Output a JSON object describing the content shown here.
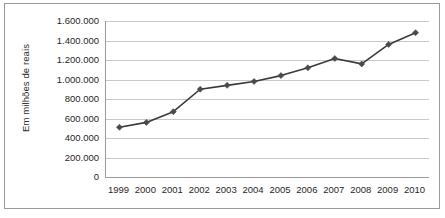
{
  "chart_data": {
    "type": "line",
    "title": "",
    "subtitle": "",
    "xlabel": "",
    "ylabel": "Em milhões de reais",
    "categories": [
      "1999",
      "2000",
      "2001",
      "2002",
      "2003",
      "2004",
      "2005",
      "2006",
      "2007",
      "2008",
      "2009",
      "2010"
    ],
    "values": [
      510000,
      560000,
      670000,
      900000,
      940000,
      980000,
      1040000,
      1120000,
      1215000,
      1160000,
      1360000,
      1480000
    ],
    "series": [
      {
        "name": "Em milhões de reais",
        "values": [
          510000,
          560000,
          670000,
          900000,
          940000,
          980000,
          1040000,
          1120000,
          1215000,
          1160000,
          1360000,
          1480000
        ]
      }
    ],
    "ylim": [
      0,
      1600000
    ],
    "ytick_values": [
      0,
      200000,
      400000,
      600000,
      800000,
      1000000,
      1200000,
      1400000,
      1600000
    ],
    "ytick_labels": [
      "0",
      "200.000",
      "400.000",
      "600.000",
      "800.000",
      "1.000.000",
      "1.200.000",
      "1.400.000",
      "1.600.000"
    ],
    "grid": true,
    "grid_axis": "y",
    "legend": false,
    "legend_position": "none",
    "marker": "diamond",
    "line_color": "#3a3a3a",
    "marker_color": "#4a4a4a",
    "grid_color": "#c9c9c9",
    "axis_color": "#9a9a9a",
    "background_color": "#ffffff",
    "annotations": []
  }
}
